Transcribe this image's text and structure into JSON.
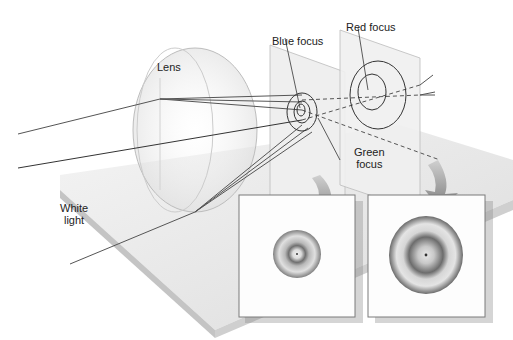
{
  "labels": {
    "lens": "Lens",
    "white_light_1": "White",
    "white_light_2": "light",
    "blue_focus": "Blue focus",
    "red_focus": "Red focus",
    "green_focus_1": "Green",
    "green_focus_2": "focus"
  },
  "colors": {
    "background": "#ffffff",
    "ray": "#555555",
    "ray_dark": "#222222",
    "plate": "#e6e6e6",
    "plate_edge": "#c8c8c8",
    "screen": "#ececec",
    "arrow": "#8a8a8a",
    "ring_dark": "#6e6e6e",
    "ring_light": "#d8d8d8",
    "frame": "#7a7a7a"
  },
  "insets": [
    {
      "name": "blue-focus-view",
      "rings": "small"
    },
    {
      "name": "red-focus-view",
      "rings": "large"
    }
  ]
}
